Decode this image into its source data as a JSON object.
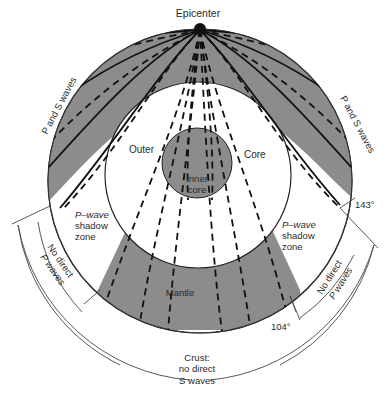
{
  "diagram": {
    "labels": {
      "epicenter": "Epicenter",
      "p_and_s_left": "P and S waves",
      "p_and_s_right": "P and S waves",
      "outer": "Outer",
      "core": "Core",
      "inner_core_1": "Inner",
      "inner_core_2": "core",
      "shadow_left_1": "P–wave",
      "shadow_left_2": "shadow",
      "shadow_left_3": "zone",
      "shadow_right_1": "P–wave",
      "shadow_right_2": "shadow",
      "shadow_right_3": "zone",
      "no_direct_left_1": "No direct",
      "no_direct_left_2": "P waves",
      "no_direct_right_1": "No direct",
      "no_direct_right_2": "P waves",
      "mantle": "Mantle",
      "angle_104": "104°",
      "angle_143": "143°",
      "crust_1": "Crust:",
      "crust_2": "no direct",
      "crust_3": "S waves"
    },
    "colors": {
      "shaded": "#8c8c8c",
      "line": "#111111",
      "background": "#ffffff"
    }
  }
}
